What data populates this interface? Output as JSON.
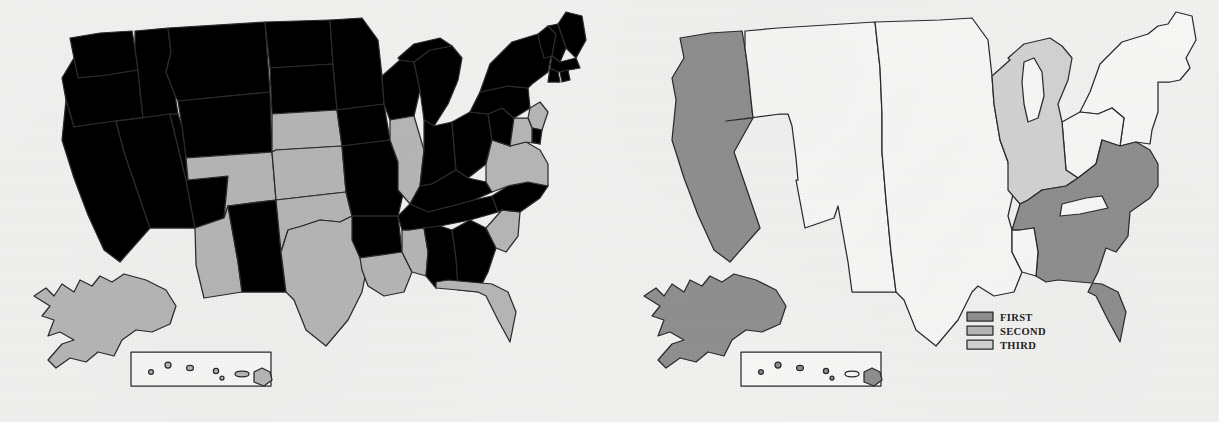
{
  "figure": {
    "kind": "choropleth-map-pair",
    "background_color": "#f1f1f0",
    "outline_color": "#2b2b2b"
  },
  "palette": {
    "first": "#8f8f8f",
    "second": "#b6b6b6",
    "third": "#d2d2d2",
    "none": "#f7f7f6",
    "outline": "#2b2b2b"
  },
  "legend": {
    "present_on": "right-map",
    "x": 357,
    "y": 312,
    "swatch_w": 26,
    "swatch_h": 9,
    "row_gap": 14,
    "items": [
      {
        "label": "FIRST",
        "color_key": "first",
        "color": "#8f8f8f"
      },
      {
        "label": "SECOND",
        "color_key": "second",
        "color": "#b6b6b6"
      },
      {
        "label": "THIRD",
        "color_key": "third",
        "color": "#d2d2d2"
      }
    ]
  },
  "maps": [
    {
      "id": "left-map",
      "name": "state-level-map",
      "level": "states",
      "shaded_fill_key": "second",
      "shaded_states": [
        "Washington",
        "Arizona",
        "Colorado",
        "Nebraska",
        "Kansas",
        "Oklahoma",
        "Texas",
        "Louisiana",
        "Mississippi",
        "Illinois",
        "South Carolina",
        "Florida",
        "Virginia",
        "Maryland",
        "New Jersey",
        "Alaska",
        "Hawaii"
      ],
      "unshaded_states": [
        "Oregon",
        "California",
        "Nevada",
        "Idaho",
        "Montana",
        "Wyoming",
        "Utah",
        "New Mexico",
        "North Dakota",
        "South Dakota",
        "Minnesota",
        "Iowa",
        "Missouri",
        "Arkansas",
        "Wisconsin",
        "Michigan",
        "Indiana",
        "Ohio",
        "Kentucky",
        "Tennessee",
        "Alabama",
        "Georgia",
        "North Carolina",
        "West Virginia",
        "Pennsylvania",
        "New York",
        "Vermont",
        "New Hampshire",
        "Maine",
        "Massachusetts",
        "Connecticut",
        "Rhode Island",
        "Delaware"
      ]
    },
    {
      "id": "right-map",
      "name": "region-level-map",
      "level": "regions",
      "regions": [
        {
          "name": "Pacific West",
          "states": [
            "Washington",
            "Oregon",
            "California"
          ],
          "rank": "FIRST",
          "color_key": "first"
        },
        {
          "name": "Southeast",
          "states": [
            "Kentucky",
            "Virginia",
            "Tennessee",
            "North Carolina",
            "South Carolina",
            "Georgia",
            "Alabama",
            "Florida",
            "West Virginia"
          ],
          "rank": "FIRST",
          "color_key": "first"
        },
        {
          "name": "Alaska",
          "states": [
            "Alaska"
          ],
          "rank": "FIRST",
          "color_key": "first"
        },
        {
          "name": "Great Lakes",
          "states": [
            "Wisconsin",
            "Michigan",
            "Illinois",
            "Indiana"
          ],
          "rank": "THIRD",
          "color_key": "third"
        },
        {
          "name": "Remainder",
          "states": [
            "Idaho",
            "Montana",
            "Wyoming",
            "Nevada",
            "Utah",
            "Arizona",
            "Colorado",
            "New Mexico",
            "North Dakota",
            "South Dakota",
            "Nebraska",
            "Kansas",
            "Oklahoma",
            "Texas",
            "Minnesota",
            "Iowa",
            "Missouri",
            "Arkansas",
            "Louisiana",
            "Mississippi",
            "Ohio",
            "Pennsylvania",
            "New York",
            "New England",
            "Mid-Atlantic"
          ],
          "rank": "NONE",
          "color_key": "none"
        }
      ],
      "hawaii_inset_shaded": true
    }
  ],
  "insets": {
    "alaska": {
      "label": "Alaska",
      "position": "lower-left"
    },
    "hawaii": {
      "label": "Hawaii",
      "position": "lower-left-box",
      "island_count": 8
    }
  }
}
